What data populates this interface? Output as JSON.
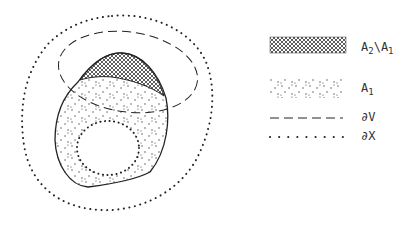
{
  "figure": {
    "regions": [
      {
        "id": "A2_minus_A1",
        "fill": "crosshatch",
        "description": "crosshatched cap of A2 lying inside V"
      },
      {
        "id": "A1",
        "fill": "stippled",
        "description": "dotted region A1"
      },
      {
        "id": "hole",
        "fill": "white",
        "description": "inner region bounded by dotted curve"
      }
    ],
    "curves": [
      {
        "id": "dV",
        "style": "dashed"
      },
      {
        "id": "dX",
        "style": "dotted"
      },
      {
        "id": "A2_boundary",
        "style": "solid"
      }
    ],
    "colors": {
      "ink": "#222222",
      "background": "#ffffff"
    }
  },
  "legend": {
    "items": [
      {
        "swatch": "crosshatch",
        "label_main": "A",
        "label_sub1": "2",
        "label_mid": "\\A",
        "label_sub2": "1"
      },
      {
        "swatch": "stipple",
        "label_main": "A",
        "label_sub1": "1"
      },
      {
        "swatch": "dashed-line",
        "label_main": "∂V"
      },
      {
        "swatch": "dotted-line",
        "label_main": "∂X"
      }
    ]
  }
}
